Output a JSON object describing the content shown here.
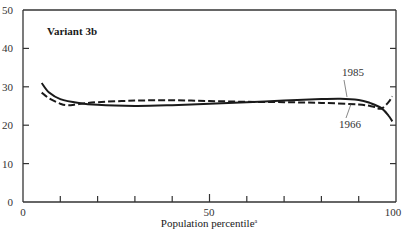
{
  "chart_data": {
    "type": "line",
    "title": "",
    "panel_label": "Variant 3b",
    "xlabel": "Population percentile",
    "xlabel_footnote": "a",
    "ylabel": "",
    "xlim": [
      0,
      100
    ],
    "ylim": [
      0,
      50
    ],
    "x_ticks_labeled": [
      0,
      50,
      100
    ],
    "x_ticks_minor": [
      10,
      20,
      30,
      40,
      60,
      70,
      80,
      90
    ],
    "y_ticks": [
      0,
      10,
      20,
      30,
      40,
      50
    ],
    "grid": false,
    "legend": "inline annotations",
    "series": [
      {
        "name": "1985",
        "style": "solid",
        "x": [
          5,
          7,
          10,
          15,
          20,
          30,
          40,
          50,
          60,
          70,
          80,
          85,
          90,
          93,
          96,
          98,
          99
        ],
        "values": [
          31,
          28.5,
          26.8,
          25.8,
          25.3,
          25,
          25.2,
          25.6,
          26,
          26.4,
          26.8,
          26.9,
          26.6,
          25.8,
          24.5,
          22.5,
          21
        ]
      },
      {
        "name": "1966",
        "style": "dashed",
        "x": [
          5,
          7,
          10,
          12,
          15,
          20,
          30,
          40,
          50,
          60,
          70,
          80,
          90,
          94,
          96,
          98,
          99
        ],
        "values": [
          28.5,
          27,
          25.6,
          25.2,
          25.5,
          26,
          26.4,
          26.5,
          26.3,
          26.1,
          26,
          25.8,
          25.4,
          24.8,
          24.3,
          26,
          27.5
        ]
      }
    ],
    "annotations": [
      {
        "text": "1985",
        "x": 87,
        "y": 30.5,
        "points_to": "1985"
      },
      {
        "text": "1966",
        "x": 87,
        "y": 20.5,
        "points_to": "1966"
      }
    ]
  },
  "labels": {
    "panel": "Variant 3b",
    "xaxis_title": "Population percentile",
    "xaxis_footnote": "a",
    "ann_1985": "1985",
    "ann_1966": "1966",
    "y0": "0",
    "y10": "10",
    "y20": "20",
    "y30": "30",
    "y40": "40",
    "y50": "50",
    "x0": "0",
    "x50": "50",
    "x100": "100"
  }
}
